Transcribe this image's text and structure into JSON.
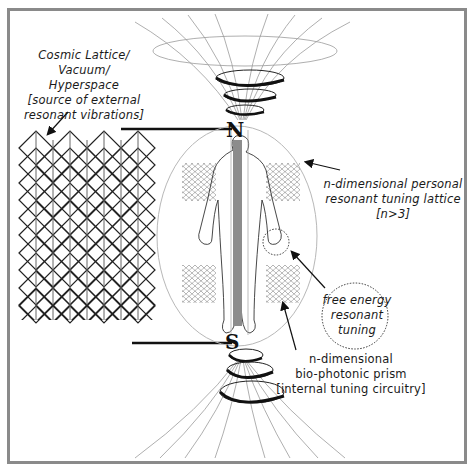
{
  "diagram": {
    "labels": {
      "cosmic_lattice": [
        "Cosmic Lattice/",
        "Vacuum/",
        "Hyperspace",
        "[source of external",
        "resonant vibrations]"
      ],
      "personal_lattice": [
        "n-dimensional personal",
        "resonant tuning lattice",
        "[n>3]"
      ],
      "free_energy": [
        "free energy",
        "resonant tuning"
      ],
      "prism": [
        "n-dimensional",
        "bio-photonic  prism",
        "[internal tuning circuitry]"
      ]
    },
    "poles": {
      "north": "N",
      "south": "S"
    },
    "colors": {
      "frame": "#8a8a8a",
      "ink": "#1a1a1a",
      "field_lines": "#9a9a9a",
      "prism_bar": "#8c8c8c",
      "aura_ellipse": "#b8b8b8"
    }
  }
}
